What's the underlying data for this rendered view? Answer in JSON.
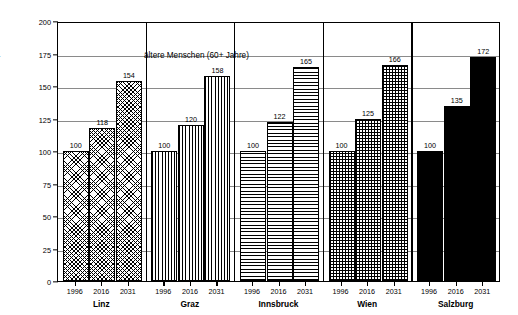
{
  "chart_data": {
    "type": "bar",
    "title": "ältere Menschen (60+ Jahre)",
    "xlabel": "",
    "ylabel": "Indexwerte; 1996=100",
    "ylim": [
      0,
      200
    ],
    "ytick_labels": [
      "0",
      "25",
      "50",
      "75",
      "100",
      "125",
      "150",
      "175",
      "200"
    ],
    "ytick_values": [
      0,
      25,
      50,
      75,
      100,
      125,
      150,
      175,
      200
    ],
    "grid": true,
    "legend": "none",
    "categories": [
      "1996",
      "2016",
      "2031"
    ],
    "groups": [
      {
        "name": "Linz",
        "pattern": "diagonal-crosshatch",
        "years": [
          "1996",
          "2016",
          "2031"
        ],
        "values": [
          100,
          118,
          154
        ],
        "labels": [
          "100",
          "118",
          "154"
        ]
      },
      {
        "name": "Graz",
        "pattern": "vertical-lines",
        "years": [
          "1996",
          "2016",
          "2031"
        ],
        "values": [
          100,
          120,
          158
        ],
        "labels": [
          "100",
          "120",
          "158"
        ]
      },
      {
        "name": "Innsbruck",
        "pattern": "horizontal-lines",
        "years": [
          "1996",
          "2016",
          "2031"
        ],
        "values": [
          100,
          122,
          165
        ],
        "labels": [
          "100",
          "122",
          "165"
        ]
      },
      {
        "name": "Wien",
        "pattern": "grid-crosshatch",
        "years": [
          "1996",
          "2016",
          "2031"
        ],
        "values": [
          100,
          125,
          166
        ],
        "labels": [
          "100",
          "125",
          "166"
        ]
      },
      {
        "name": "Salzburg",
        "pattern": "solid-black",
        "years": [
          "1996",
          "2016",
          "2031"
        ],
        "values": [
          100,
          135,
          172
        ],
        "labels": [
          "100",
          "135",
          "172"
        ]
      }
    ],
    "colors": {
      "axis": "#000000",
      "grid": "#8a8a8a",
      "bar_outline": "#000000",
      "bar_fill": "#ffffff",
      "solid_bar": "#000000",
      "background": "#ffffff"
    }
  }
}
